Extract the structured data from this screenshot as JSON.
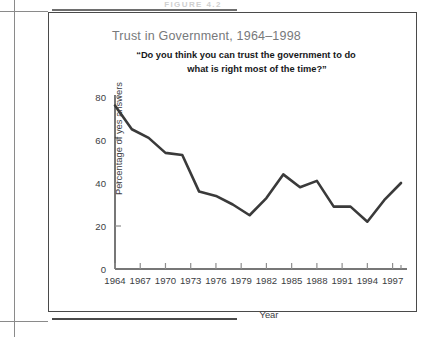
{
  "page": {
    "figure_label": "FIGURE 4.2"
  },
  "chart_data": {
    "type": "line",
    "title": "Trust in Government, 1964–1998",
    "subtitle_line1": "“Do you think you can trust the government to do",
    "subtitle_line2": "what is right most of the time?”",
    "xlabel": "Year",
    "ylabel": "Percentage of yes answers",
    "ylim": [
      0,
      80
    ],
    "xlim": [
      1964,
      1998
    ],
    "ytick_labels": [
      "0",
      "20",
      "40",
      "60",
      "80"
    ],
    "ytick_values": [
      0,
      20,
      40,
      60,
      80
    ],
    "xtick_labels": [
      "1964",
      "1967",
      "1970",
      "1973",
      "1976",
      "1979",
      "1982",
      "1985",
      "1988",
      "1991",
      "1994",
      "1997"
    ],
    "xtick_values": [
      1964,
      1967,
      1970,
      1973,
      1976,
      1979,
      1982,
      1985,
      1988,
      1991,
      1994,
      1997
    ],
    "grid": false,
    "legend": "none",
    "line_color": "#3a3a3a",
    "x": [
      1964,
      1966,
      1968,
      1970,
      1972,
      1974,
      1976,
      1978,
      1980,
      1982,
      1984,
      1986,
      1988,
      1990,
      1992,
      1994,
      1996,
      1998
    ],
    "values": [
      76,
      65,
      61,
      54,
      53,
      36,
      34,
      30,
      25,
      33,
      44,
      38,
      41,
      29,
      29,
      22,
      32,
      40
    ],
    "series": [
      {
        "name": "Percentage of yes answers",
        "x": [
          1964,
          1966,
          1968,
          1970,
          1972,
          1974,
          1976,
          1978,
          1980,
          1982,
          1984,
          1986,
          1988,
          1990,
          1992,
          1994,
          1996,
          1998
        ],
        "values": [
          76,
          65,
          61,
          54,
          53,
          36,
          34,
          30,
          25,
          33,
          44,
          38,
          41,
          29,
          29,
          22,
          32,
          40
        ]
      }
    ]
  }
}
